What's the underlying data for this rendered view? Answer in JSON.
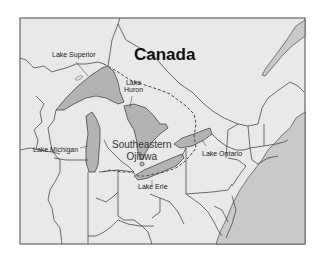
{
  "map": {
    "country_label": "Canada",
    "region_label_line1": "Southeastern",
    "region_label_line2": "Ojibwa",
    "lakes": {
      "superior": "Lake Superior",
      "huron_line1": "Lake",
      "huron_line2": "Huron",
      "michigan": "Lake Michigan",
      "ontario": "Lake Ontario",
      "erie": "Lake Erie"
    },
    "colors": {
      "land": "#e9e9e9",
      "ocean": "#c9c9c9",
      "lake": "#b3b3b3",
      "border": "#333333",
      "frame": "#666666"
    }
  }
}
